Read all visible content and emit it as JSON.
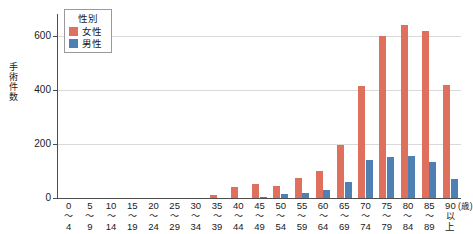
{
  "chart_data": {
    "type": "bar",
    "title": "",
    "subtitle": "",
    "xlabel": "(歳)",
    "ylabel": "手術件数",
    "ylim": [
      0,
      680
    ],
    "yticks": [
      0,
      200,
      400,
      600
    ],
    "ytick_labels": [
      "0",
      "200",
      "400",
      "600"
    ],
    "grid": true,
    "legend_position": "top-left",
    "legend_title": "性別",
    "categories": [
      "0〜4",
      "5〜9",
      "10〜14",
      "15〜19",
      "20〜24",
      "25〜29",
      "30〜34",
      "35〜39",
      "40〜44",
      "45〜49",
      "50〜54",
      "55〜59",
      "60〜64",
      "65〜69",
      "70〜74",
      "75〜79",
      "80〜84",
      "85〜89",
      "90以上"
    ],
    "category_lines": [
      [
        "0",
        "〜",
        "4"
      ],
      [
        "5",
        "〜",
        "9"
      ],
      [
        "10",
        "〜",
        "14"
      ],
      [
        "15",
        "〜",
        "19"
      ],
      [
        "20",
        "〜",
        "24"
      ],
      [
        "25",
        "〜",
        "29"
      ],
      [
        "30",
        "〜",
        "34"
      ],
      [
        "35",
        "〜",
        "39"
      ],
      [
        "40",
        "〜",
        "44"
      ],
      [
        "45",
        "〜",
        "49"
      ],
      [
        "50",
        "〜",
        "54"
      ],
      [
        "55",
        "〜",
        "59"
      ],
      [
        "60",
        "〜",
        "64"
      ],
      [
        "65",
        "〜",
        "69"
      ],
      [
        "70",
        "〜",
        "74"
      ],
      [
        "75",
        "〜",
        "79"
      ],
      [
        "80",
        "〜",
        "84"
      ],
      [
        "85",
        "〜",
        "89"
      ],
      [
        "90",
        "以",
        "上"
      ]
    ],
    "series": [
      {
        "name": "女性",
        "color": "#e0705e",
        "values": [
          0,
          0,
          0,
          0,
          0,
          0,
          0,
          10,
          42,
          50,
          46,
          75,
          100,
          197,
          413,
          600,
          640,
          618,
          418
        ]
      },
      {
        "name": "男性",
        "color": "#4e80b4",
        "values": [
          0,
          0,
          0,
          0,
          0,
          0,
          0,
          0,
          0,
          4,
          13,
          20,
          30,
          60,
          140,
          150,
          155,
          133,
          70
        ]
      }
    ],
    "axis_unit_note": "(歳)"
  },
  "legend": {
    "title": "性別",
    "items": [
      {
        "label": "女性",
        "color": "#e0705e"
      },
      {
        "label": "男性",
        "color": "#4e80b4"
      }
    ]
  },
  "axes": {
    "y_title": "手術件数",
    "x_unit": "(歳)"
  }
}
